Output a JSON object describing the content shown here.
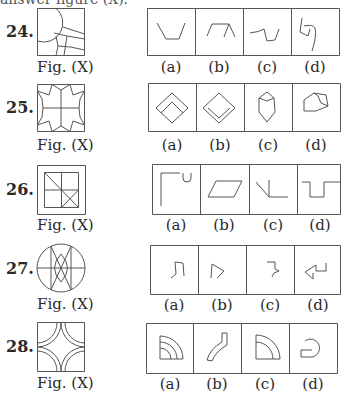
{
  "header": {
    "cut_text": "answer figure (X)."
  },
  "questions": [
    {
      "number": "24.",
      "figure_label": "Fig. (X)",
      "options": [
        "(a)",
        "(b)",
        "(c)",
        "(d)"
      ]
    },
    {
      "number": "25.",
      "figure_label": "Fig. (X)",
      "options": [
        "(a)",
        "(b)",
        "(c)",
        "(d)"
      ]
    },
    {
      "number": "26.",
      "figure_label": "Fig. (X)",
      "options": [
        "(a)",
        "(b)",
        "(c)",
        "(d)"
      ]
    },
    {
      "number": "27.",
      "figure_label": "Fig. (X)",
      "options": [
        "(a)",
        "(b)",
        "(c)",
        "(d)"
      ]
    },
    {
      "number": "28.",
      "figure_label": "Fig. (X)",
      "options": [
        "(a)",
        "(b)",
        "(c)",
        "(d)"
      ]
    }
  ],
  "colors": {
    "line": "#555555",
    "text": "#2a2a2a",
    "background": "#ffffff"
  }
}
